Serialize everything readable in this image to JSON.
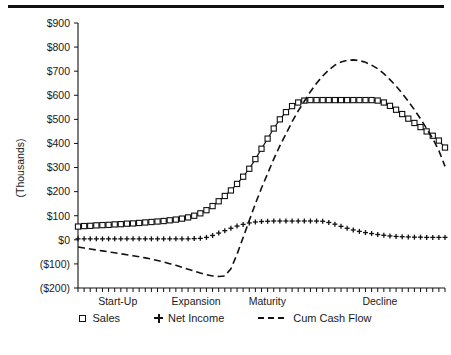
{
  "chart_data": {
    "type": "line",
    "title": "",
    "subtitle": "",
    "xlabel": "",
    "ylabel": "(Thousands)",
    "ylim": [
      -200,
      900
    ],
    "yticks": [
      900,
      800,
      700,
      600,
      500,
      400,
      300,
      200,
      100,
      0,
      -100,
      -200
    ],
    "ytick_labels": [
      "$900",
      "$800",
      "$700",
      "$600",
      "$500",
      "$400",
      "$300",
      "$200",
      "$100",
      "$0",
      "($100)",
      "($200)"
    ],
    "grid": false,
    "legend_position": "bottom",
    "stage_labels": [
      "Start-Up",
      "Expansion",
      "Maturity",
      "Decline"
    ],
    "stage_label_x_frac": [
      0.055,
      0.255,
      0.465,
      0.775
    ],
    "x_tick_count": 61,
    "x": [
      0,
      1,
      2,
      3,
      4,
      5,
      6,
      7,
      8,
      9,
      10,
      11,
      12,
      13,
      14,
      15,
      16,
      17,
      18,
      19,
      20,
      21,
      22,
      23,
      24,
      25,
      26,
      27,
      28,
      29,
      30,
      31,
      32,
      33,
      34,
      35,
      36,
      37,
      38,
      39,
      40,
      41,
      42,
      43,
      44,
      45,
      46,
      47,
      48,
      49,
      50,
      51,
      52,
      53,
      54,
      55,
      56,
      57,
      58,
      59,
      60
    ],
    "series": [
      {
        "name": "Sales",
        "marker": "open-square",
        "line": "solid",
        "color": "#111111",
        "values": [
          55,
          57,
          58,
          60,
          61,
          62,
          64,
          65,
          67,
          68,
          70,
          72,
          74,
          76,
          78,
          81,
          84,
          88,
          93,
          100,
          110,
          123,
          140,
          160,
          182,
          205,
          232,
          262,
          295,
          335,
          378,
          420,
          462,
          500,
          530,
          555,
          570,
          578,
          580,
          580,
          580,
          580,
          580,
          580,
          580,
          580,
          580,
          580,
          580,
          578,
          570,
          556,
          540,
          522,
          503,
          485,
          468,
          450,
          432,
          412,
          383
        ]
      },
      {
        "name": "Net Income",
        "marker": "plus",
        "line": "none",
        "color": "#111111",
        "values": [
          4,
          4,
          4,
          4,
          4,
          4,
          4,
          4,
          4,
          4,
          4,
          4,
          4,
          4,
          4,
          4,
          4,
          4,
          4,
          5,
          6,
          10,
          18,
          28,
          38,
          48,
          57,
          64,
          70,
          74,
          76,
          77,
          78,
          78,
          78,
          78,
          78,
          78,
          78,
          78,
          77,
          72,
          65,
          56,
          48,
          41,
          35,
          30,
          26,
          22,
          19,
          16,
          14,
          13,
          12,
          11,
          11,
          10,
          10,
          10,
          10
        ]
      },
      {
        "name": "Cum Cash Flow",
        "marker": "none",
        "line": "dashed",
        "color": "#111111",
        "values": [
          -30,
          -34,
          -38,
          -42,
          -46,
          -50,
          -54,
          -58,
          -62,
          -66,
          -70,
          -75,
          -80,
          -86,
          -92,
          -99,
          -106,
          -114,
          -122,
          -130,
          -138,
          -145,
          -150,
          -152,
          -150,
          -120,
          -60,
          10,
          80,
          150,
          215,
          275,
          335,
          390,
          440,
          490,
          535,
          575,
          615,
          650,
          680,
          705,
          725,
          738,
          745,
          747,
          744,
          737,
          725,
          710,
          690,
          665,
          638,
          608,
          575,
          540,
          502,
          462,
          420,
          370,
          305
        ]
      }
    ],
    "legend": [
      {
        "label": "Sales",
        "marker": "open-square"
      },
      {
        "label": "Net Income",
        "marker": "plus"
      },
      {
        "label": "Cum Cash Flow",
        "marker": "dashed-line"
      }
    ]
  }
}
